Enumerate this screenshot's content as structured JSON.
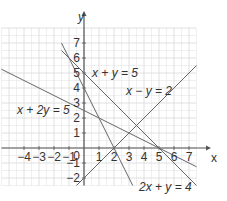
{
  "chart_data": {
    "type": "line",
    "title": "",
    "xlabel": "x",
    "ylabel": "y",
    "xlim": [
      -5.5,
      7.5
    ],
    "ylim": [
      -2.5,
      8
    ],
    "grid": true,
    "x_ticks": [
      "-4",
      "-3",
      "-2",
      "-1",
      "1",
      "2",
      "3",
      "4",
      "5",
      "6",
      "7"
    ],
    "y_ticks": [
      "-2",
      "-1",
      "1",
      "2",
      "3",
      "4",
      "5",
      "6",
      "7"
    ],
    "origin_label": "0",
    "series": [
      {
        "name": "x + y = 5",
        "equation": "y = 5 - x",
        "x": [
          -1.5,
          7.5
        ],
        "y": [
          6.5,
          -2.5
        ]
      },
      {
        "name": "x - y = 2",
        "equation": "y = x - 2",
        "x": [
          -0.5,
          7.5
        ],
        "y": [
          -2.5,
          5.5
        ]
      },
      {
        "name": "x + 2y = 5",
        "equation": "y = (5 - x)/2",
        "x": [
          -5.5,
          7.5
        ],
        "y": [
          5.25,
          -1.25
        ]
      },
      {
        "name": "2x + y = 4",
        "equation": "y = 4 - 2x",
        "x": [
          -1.5,
          3.25
        ],
        "y": [
          7,
          -2.5
        ]
      }
    ],
    "annotations": [
      "x + y = 5",
      "x - y = 2",
      "x + 2y = 5",
      "2x + y = 4"
    ]
  },
  "labels": {
    "x_axis": "x",
    "y_axis": "y",
    "origin": "0",
    "eq1": "x + y = 5",
    "eq2": "x − y = 2",
    "eq3": "x + 2y = 5",
    "eq4": "2x + y = 4"
  },
  "colors": {
    "grid": "#d8d8d8",
    "axis": "#555555",
    "line": "#666666",
    "text": "#333333"
  }
}
